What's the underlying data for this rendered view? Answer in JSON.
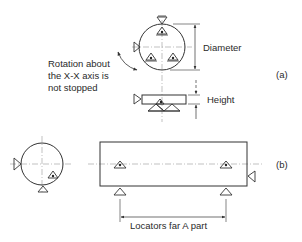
{
  "diagram": {
    "part_a": {
      "tag": "(a)",
      "labels": {
        "diameter": "Diameter",
        "height": "Height",
        "rotation_note_line1": "Rotation about",
        "rotation_note_line2": "the X-X axis is",
        "rotation_note_line3": "not stopped"
      }
    },
    "part_b": {
      "tag": "(b)",
      "labels": {
        "locators": "Locators far A part"
      }
    },
    "colors": {
      "line": "#333333",
      "centerline": "#888888",
      "background": "#ffffff"
    }
  }
}
